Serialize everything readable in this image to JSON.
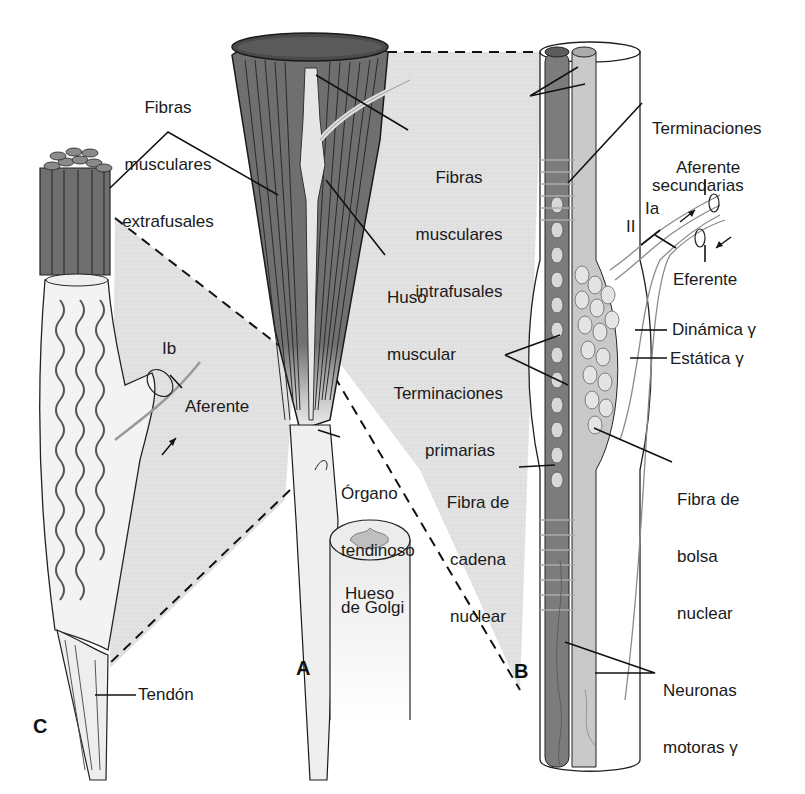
{
  "diagram": {
    "type": "anatomical-illustration",
    "colors": {
      "background": "#ffffff",
      "muscle_dark": "#6f6f6f",
      "muscle_line": "#2b2b2b",
      "zoom_fill": "#e3e3e3",
      "sheath_fill": "#f2f2f2",
      "chain_fiber": "#7c7c7c",
      "bag_fiber": "#bdbdbd",
      "nerve_gray": "#9a9a9a",
      "text": "#1a1a1a"
    },
    "panels": {
      "A": "A",
      "B": "B",
      "C": "C"
    },
    "labels": {
      "extrafusal": [
        "Fibras",
        "musculares",
        "extrafusales"
      ],
      "intrafusal": [
        "Fibras",
        "musculares",
        "intrafusales"
      ],
      "spindle": [
        "Huso",
        "muscular"
      ],
      "secondary_endings": [
        "Terminaciones",
        "secundarias"
      ],
      "afferent_top": "Aferente",
      "ia": "Ia",
      "ii": "II",
      "efferent": "Eferente",
      "dynamic_gamma": "Dinámica γ",
      "static_gamma": "Estática γ",
      "primary_endings": [
        "Terminaciones",
        "primarias"
      ],
      "golgi_organ": [
        "Órgano",
        "tendinoso",
        "de Golgi"
      ],
      "chain_fiber": [
        "Fibra de",
        "cadena",
        "nuclear"
      ],
      "bag_fiber": [
        "Fibra de",
        "bolsa",
        "nuclear"
      ],
      "bone": "Hueso",
      "ib": "Ib",
      "afferent_c": "Aferente",
      "tendon": "Tendón",
      "gamma_motor": [
        "Neuronas",
        "motoras γ"
      ]
    }
  }
}
